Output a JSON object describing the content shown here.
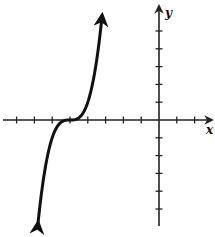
{
  "chart_data": {
    "type": "line",
    "title": "",
    "xlabel": "x",
    "ylabel": "y",
    "function": "y = (x + 5)^3",
    "xlim": [
      -8.5,
      3
    ],
    "ylim": [
      -6,
      6
    ],
    "x_ticks": [
      -8,
      -7,
      -6,
      -5,
      -4,
      -3,
      -2,
      -1,
      1,
      2
    ],
    "y_ticks": [
      -5,
      -4,
      -3,
      -2,
      -1,
      1,
      2,
      3,
      4,
      5
    ],
    "tick_labels_shown": false,
    "grid": false,
    "legend": null,
    "series": [
      {
        "name": "curve",
        "x": [
          -6.8,
          -6.5,
          -6.2,
          -6.0,
          -5.8,
          -5.5,
          -5.2,
          -5.0,
          -4.8,
          -4.5,
          -4.2,
          -4.0,
          -3.8,
          -3.5,
          -3.2
        ],
        "values": [
          -5.83,
          -3.38,
          -1.73,
          -1.0,
          -0.51,
          -0.13,
          -0.01,
          0.0,
          0.01,
          0.13,
          0.51,
          1.0,
          1.73,
          3.38,
          5.83
        ],
        "arrows_at_ends": true
      }
    ],
    "annotations": [
      "inflection point at (-5, 0)"
    ]
  },
  "axes": {
    "x_label": "x",
    "y_label": "y"
  },
  "colors": {
    "curve": "#111111",
    "axes": "#222222",
    "background": "#ffffff"
  }
}
